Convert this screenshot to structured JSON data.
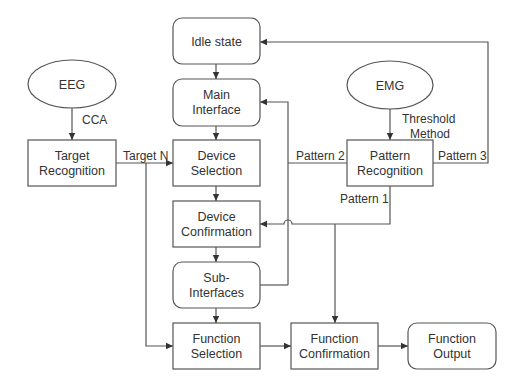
{
  "diagram": {
    "nodes": {
      "idle_state": {
        "line1": "Idle state",
        "shape": "rounded"
      },
      "main_interface": {
        "line1": "Main",
        "line2": "Interface",
        "shape": "rounded"
      },
      "device_selection": {
        "line1": "Device",
        "line2": "Selection",
        "shape": "rect"
      },
      "device_confirmation": {
        "line1": "Device",
        "line2": "Confirmation",
        "shape": "rect"
      },
      "sub_interfaces": {
        "line1": "Sub-",
        "line2": "Interfaces",
        "shape": "rounded"
      },
      "function_selection": {
        "line1": "Function",
        "line2": "Selection",
        "shape": "rect"
      },
      "function_confirmation": {
        "line1": "Function",
        "line2": "Confirmation",
        "shape": "rect"
      },
      "function_output": {
        "line1": "Function",
        "line2": "Output",
        "shape": "rounded"
      },
      "eeg": {
        "line1": "EEG",
        "shape": "ellipse"
      },
      "target_recognition": {
        "line1": "Target",
        "line2": "Recognition",
        "shape": "rect"
      },
      "emg": {
        "line1": "EMG",
        "shape": "ellipse"
      },
      "pattern_recognition": {
        "line1": "Pattern",
        "line2": "Recognition",
        "shape": "rect"
      }
    },
    "edge_labels": {
      "cca": "CCA",
      "threshold_line1": "Threshold",
      "threshold_line2": "Method",
      "target_n": "Target N",
      "pattern_1": "Pattern 1",
      "pattern_2": "Pattern 2",
      "pattern_3": "Pattern 3"
    },
    "edges": [
      {
        "from": "Idle state",
        "to": "Main Interface"
      },
      {
        "from": "Main Interface",
        "to": "Device Selection"
      },
      {
        "from": "Device Selection",
        "to": "Device Confirmation"
      },
      {
        "from": "Device Confirmation",
        "to": "Sub-Interfaces"
      },
      {
        "from": "Sub-Interfaces",
        "to": "Function Selection"
      },
      {
        "from": "Function Selection",
        "to": "Function Confirmation"
      },
      {
        "from": "Function Confirmation",
        "to": "Function Output"
      },
      {
        "from": "EEG",
        "to": "Target Recognition",
        "label": "CCA"
      },
      {
        "from": "Target Recognition",
        "to": "Device Selection",
        "label": "Target N"
      },
      {
        "from": "Target Recognition",
        "to": "Function Selection",
        "label": "Target N"
      },
      {
        "from": "EMG",
        "to": "Pattern Recognition",
        "label": "Threshold Method"
      },
      {
        "from": "Pattern Recognition",
        "to": "Main Interface",
        "label": "Pattern 2"
      },
      {
        "from": "Sub-Interfaces",
        "to": "Main Interface",
        "label": "Pattern 2"
      },
      {
        "from": "Pattern Recognition",
        "to": "Idle state",
        "label": "Pattern 3"
      },
      {
        "from": "Pattern Recognition",
        "to": "Device Confirmation",
        "label": "Pattern 1"
      },
      {
        "from": "Pattern Recognition",
        "to": "Function Confirmation",
        "label": "Pattern 1"
      }
    ]
  }
}
